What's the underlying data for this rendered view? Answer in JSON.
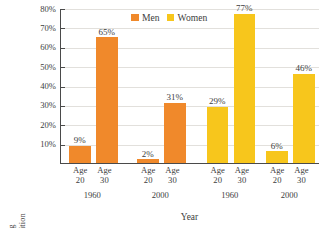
{
  "chart_data": {
    "type": "bar",
    "title": "",
    "xlabel": "Year",
    "ylabel": "Percentage Having Completed the Transition",
    "ylabel_lines": [
      "Percentage Having",
      "Completed the Transition"
    ],
    "ylim": [
      0,
      80
    ],
    "ytick_labels": [
      "80%",
      "70%",
      "60%",
      "50%",
      "40%",
      "30%",
      "20%",
      "10%"
    ],
    "ytick_values": [
      80,
      70,
      60,
      50,
      40,
      30,
      20,
      10
    ],
    "grid": true,
    "legend_position": "top-center",
    "legend": [
      {
        "name": "Men",
        "color": "#F0892B"
      },
      {
        "name": "Women",
        "color": "#F7C61C"
      }
    ],
    "age_label_line1": "Age",
    "groups": [
      {
        "series": "Men",
        "year": "1960",
        "color": "#F0892B",
        "bars": [
          {
            "age": "20",
            "value": 9,
            "label": "9%"
          },
          {
            "age": "30",
            "value": 65,
            "label": "65%"
          }
        ]
      },
      {
        "series": "Men",
        "year": "2000",
        "color": "#F0892B",
        "bars": [
          {
            "age": "20",
            "value": 2,
            "label": "2%"
          },
          {
            "age": "30",
            "value": 31,
            "label": "31%"
          }
        ]
      },
      {
        "series": "Women",
        "year": "1960",
        "color": "#F7C61C",
        "bars": [
          {
            "age": "20",
            "value": 29,
            "label": "29%"
          },
          {
            "age": "30",
            "value": 77,
            "label": "77%"
          }
        ]
      },
      {
        "series": "Women",
        "year": "2000",
        "color": "#F7C61C",
        "bars": [
          {
            "age": "20",
            "value": 6,
            "label": "6%"
          },
          {
            "age": "30",
            "value": 46,
            "label": "46%"
          }
        ]
      }
    ],
    "categories": [
      "Men 1960 Age 20",
      "Men 1960 Age 30",
      "Men 2000 Age 20",
      "Men 2000 Age 30",
      "Women 1960 Age 20",
      "Women 1960 Age 30",
      "Women 2000 Age 20",
      "Women 2000 Age 30"
    ],
    "values": [
      9,
      65,
      2,
      31,
      29,
      77,
      6,
      46
    ]
  }
}
